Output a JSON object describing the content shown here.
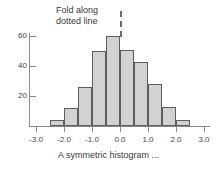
{
  "chart_data": {
    "type": "bar",
    "title": "",
    "subtitle": "",
    "caption": "A symmetric histogram ...",
    "xlabel": "",
    "ylabel": "",
    "xlim": [
      -3.0,
      3.0
    ],
    "ylim": [
      0,
      65
    ],
    "grid": false,
    "legend": null,
    "bin_width": 0.5,
    "x_ticks": [
      {
        "value": -3.0,
        "label": "-3.0"
      },
      {
        "value": -2.0,
        "label": "-2.0"
      },
      {
        "value": -1.0,
        "label": "-1.0"
      },
      {
        "value": 0.0,
        "label": "0.0"
      },
      {
        "value": 1.0,
        "label": "1.0"
      },
      {
        "value": 2.0,
        "label": "2.0"
      },
      {
        "value": 3.0,
        "label": "3.0"
      }
    ],
    "y_ticks": [
      {
        "value": 20,
        "label": "20"
      },
      {
        "value": 40,
        "label": "40"
      },
      {
        "value": 60,
        "label": "60"
      }
    ],
    "bins": [
      {
        "left": -2.5,
        "right": -2.0,
        "center": -2.25,
        "value": 4
      },
      {
        "left": -2.0,
        "right": -1.5,
        "center": -1.75,
        "value": 12
      },
      {
        "left": -1.5,
        "right": -1.0,
        "center": -1.25,
        "value": 26
      },
      {
        "left": -1.0,
        "right": -0.5,
        "center": -0.75,
        "value": 50
      },
      {
        "left": -0.5,
        "right": 0.0,
        "center": -0.25,
        "value": 60
      },
      {
        "left": 0.0,
        "right": 0.5,
        "center": 0.25,
        "value": 51
      },
      {
        "left": 0.5,
        "right": 1.0,
        "center": 0.75,
        "value": 43
      },
      {
        "left": 1.0,
        "right": 1.5,
        "center": 1.25,
        "value": 28
      },
      {
        "left": 1.5,
        "right": 2.0,
        "center": 1.75,
        "value": 13
      },
      {
        "left": 2.0,
        "right": 2.5,
        "center": 2.25,
        "value": 4
      }
    ],
    "categories": [
      "-2.25",
      "-1.75",
      "-1.25",
      "-0.75",
      "-0.25",
      "0.25",
      "0.75",
      "1.25",
      "1.75",
      "2.25"
    ],
    "values": [
      4,
      12,
      26,
      50,
      60,
      51,
      43,
      28,
      13,
      4
    ],
    "annotations": [
      {
        "name": "fold-annotation",
        "lines": [
          "Fold along",
          "dotted line"
        ],
        "target_x": 0.0,
        "marker": "dashed-vertical-line"
      }
    ],
    "colors": {
      "bar_fill": "#d2d2d2",
      "bar_stroke": "#5e5e5e",
      "axis": "#8a8a8a",
      "text": "#3a3a3a",
      "fold_line": "#6b6b6b",
      "background": "#ffffff"
    }
  }
}
